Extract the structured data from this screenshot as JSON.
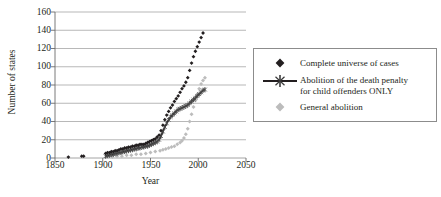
{
  "chart_data": {
    "type": "scatter",
    "title": "",
    "xlabel": "Year",
    "ylabel": "Number of states",
    "xlim": [
      1850,
      2050
    ],
    "ylim": [
      0,
      160
    ],
    "xticks": [
      1850,
      1900,
      1950,
      2000,
      2050
    ],
    "yticks": [
      0,
      20,
      40,
      60,
      80,
      100,
      120,
      140,
      160
    ],
    "grid": "horizontal",
    "legend_position": "right",
    "series": [
      {
        "name": "Complete universe of cases",
        "marker": "diamond",
        "color": "#231f20",
        "points": [
          [
            1864,
            1
          ],
          [
            1878,
            2
          ],
          [
            1880,
            2
          ],
          [
            1903,
            5
          ],
          [
            1905,
            6
          ],
          [
            1907,
            6
          ],
          [
            1909,
            7
          ],
          [
            1911,
            7
          ],
          [
            1913,
            8
          ],
          [
            1915,
            8
          ],
          [
            1917,
            9
          ],
          [
            1919,
            10
          ],
          [
            1921,
            10
          ],
          [
            1923,
            11
          ],
          [
            1925,
            11
          ],
          [
            1927,
            12
          ],
          [
            1929,
            12
          ],
          [
            1931,
            13
          ],
          [
            1933,
            13
          ],
          [
            1935,
            14
          ],
          [
            1937,
            14
          ],
          [
            1939,
            15
          ],
          [
            1941,
            15
          ],
          [
            1943,
            15
          ],
          [
            1945,
            16
          ],
          [
            1947,
            17
          ],
          [
            1949,
            18
          ],
          [
            1951,
            19
          ],
          [
            1953,
            20
          ],
          [
            1955,
            21
          ],
          [
            1957,
            23
          ],
          [
            1959,
            25
          ],
          [
            1961,
            30
          ],
          [
            1963,
            36
          ],
          [
            1965,
            42
          ],
          [
            1967,
            47
          ],
          [
            1969,
            51
          ],
          [
            1971,
            55
          ],
          [
            1973,
            58
          ],
          [
            1975,
            62
          ],
          [
            1977,
            65
          ],
          [
            1979,
            68
          ],
          [
            1981,
            72
          ],
          [
            1983,
            76
          ],
          [
            1985,
            79
          ],
          [
            1987,
            83
          ],
          [
            1989,
            88
          ],
          [
            1991,
            96
          ],
          [
            1993,
            104
          ],
          [
            1995,
            111
          ],
          [
            1997,
            117
          ],
          [
            1999,
            122
          ],
          [
            2001,
            127
          ],
          [
            2003,
            132
          ],
          [
            2005,
            137
          ]
        ]
      },
      {
        "name": "Abolition of the death penalty for child offenders ONLY",
        "marker": "cross-line",
        "color": "#231f20",
        "points": [
          [
            1903,
            2
          ],
          [
            1905,
            3
          ],
          [
            1907,
            3
          ],
          [
            1909,
            4
          ],
          [
            1911,
            4
          ],
          [
            1913,
            5
          ],
          [
            1915,
            5
          ],
          [
            1917,
            6
          ],
          [
            1919,
            6
          ],
          [
            1921,
            7
          ],
          [
            1923,
            7
          ],
          [
            1925,
            8
          ],
          [
            1927,
            8
          ],
          [
            1929,
            9
          ],
          [
            1931,
            9
          ],
          [
            1933,
            10
          ],
          [
            1935,
            10
          ],
          [
            1937,
            11
          ],
          [
            1939,
            11
          ],
          [
            1941,
            12
          ],
          [
            1943,
            12
          ],
          [
            1945,
            13
          ],
          [
            1947,
            13
          ],
          [
            1949,
            14
          ],
          [
            1951,
            15
          ],
          [
            1953,
            16
          ],
          [
            1955,
            17
          ],
          [
            1957,
            18
          ],
          [
            1959,
            20
          ],
          [
            1961,
            24
          ],
          [
            1963,
            29
          ],
          [
            1965,
            34
          ],
          [
            1967,
            38
          ],
          [
            1969,
            42
          ],
          [
            1971,
            45
          ],
          [
            1973,
            47
          ],
          [
            1975,
            49
          ],
          [
            1977,
            51
          ],
          [
            1979,
            53
          ],
          [
            1981,
            54
          ],
          [
            1983,
            55
          ],
          [
            1985,
            56
          ],
          [
            1987,
            57
          ],
          [
            1989,
            58
          ],
          [
            1991,
            60
          ],
          [
            1993,
            62
          ],
          [
            1995,
            64
          ],
          [
            1997,
            66
          ],
          [
            1999,
            68
          ],
          [
            2001,
            70
          ],
          [
            2003,
            72
          ],
          [
            2005,
            74
          ],
          [
            2007,
            75
          ]
        ]
      },
      {
        "name": "General abolition",
        "marker": "diamond",
        "color": "#bcbcbc",
        "points": [
          [
            1905,
            1
          ],
          [
            1910,
            1
          ],
          [
            1915,
            2
          ],
          [
            1920,
            2
          ],
          [
            1925,
            3
          ],
          [
            1930,
            3
          ],
          [
            1935,
            4
          ],
          [
            1940,
            4
          ],
          [
            1945,
            5
          ],
          [
            1950,
            6
          ],
          [
            1955,
            7
          ],
          [
            1960,
            8
          ],
          [
            1963,
            9
          ],
          [
            1966,
            10
          ],
          [
            1969,
            11
          ],
          [
            1972,
            12
          ],
          [
            1975,
            13
          ],
          [
            1978,
            15
          ],
          [
            1981,
            17
          ],
          [
            1983,
            19
          ],
          [
            1985,
            22
          ],
          [
            1987,
            26
          ],
          [
            1989,
            32
          ],
          [
            1991,
            40
          ],
          [
            1993,
            48
          ],
          [
            1995,
            56
          ],
          [
            1997,
            63
          ],
          [
            1999,
            70
          ],
          [
            2001,
            76
          ],
          [
            2003,
            81
          ],
          [
            2005,
            85
          ],
          [
            2007,
            88
          ]
        ]
      }
    ]
  },
  "axes": {
    "ylabel": "Number of states",
    "xlabel": "Year",
    "ytick_labels": [
      "160",
      "140",
      "120",
      "100",
      "80",
      "60",
      "40",
      "20",
      "0"
    ],
    "xtick_labels": [
      "1850",
      "1900",
      "1950",
      "2000",
      "2050"
    ]
  },
  "legend": {
    "entries": [
      {
        "label": "Complete universe of cases",
        "label2": "",
        "marker": "diamond-dark",
        "color": "#231f20"
      },
      {
        "label": "Abolition of the death penalty",
        "label2": "for child offenders ONLY",
        "marker": "line-cross",
        "color": "#231f20"
      },
      {
        "label": "General abolition",
        "label2": "",
        "marker": "diamond-light",
        "color": "#bcbcbc"
      }
    ]
  }
}
